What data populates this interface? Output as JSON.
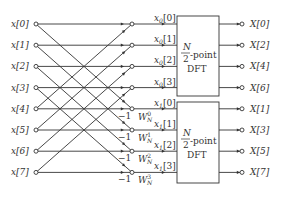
{
  "inputs": [
    "x[0]",
    "x[1]",
    "x[2]",
    "x[3]",
    "x[4]",
    "x[5]",
    "x[6]",
    "x[7]"
  ],
  "even_labels": [
    {
      "base": "x",
      "sub": "0",
      "idx": "[0]"
    },
    {
      "base": "x",
      "sub": "0",
      "idx": "[1]"
    },
    {
      "base": "x",
      "sub": "0",
      "idx": "[2]"
    },
    {
      "base": "x",
      "sub": "0",
      "idx": "[3]"
    }
  ],
  "odd_labels": [
    {
      "base": "x",
      "sub": "1",
      "idx": "[0]"
    },
    {
      "base": "x",
      "sub": "1",
      "idx": "[1]"
    },
    {
      "base": "x",
      "sub": "1",
      "idx": "[2]"
    },
    {
      "base": "x",
      "sub": "1",
      "idx": "[3]"
    }
  ],
  "minus_one": "−1",
  "twiddles": [
    {
      "base": "W",
      "sub": "N",
      "sup": "0"
    },
    {
      "base": "W",
      "sub": "N",
      "sup": "1"
    },
    {
      "base": "W",
      "sub": "N",
      "sup": "2"
    },
    {
      "base": "W",
      "sub": "N",
      "sup": "3"
    }
  ],
  "dft_box": {
    "numerator": "N",
    "denominator": "2",
    "suffix": "-point",
    "name": "DFT"
  },
  "outputs_top": [
    "X[0]",
    "X[2]",
    "X[4]",
    "X[6]"
  ],
  "outputs_bottom": [
    "X[1]",
    "X[3]",
    "X[5]",
    "X[7]"
  ]
}
